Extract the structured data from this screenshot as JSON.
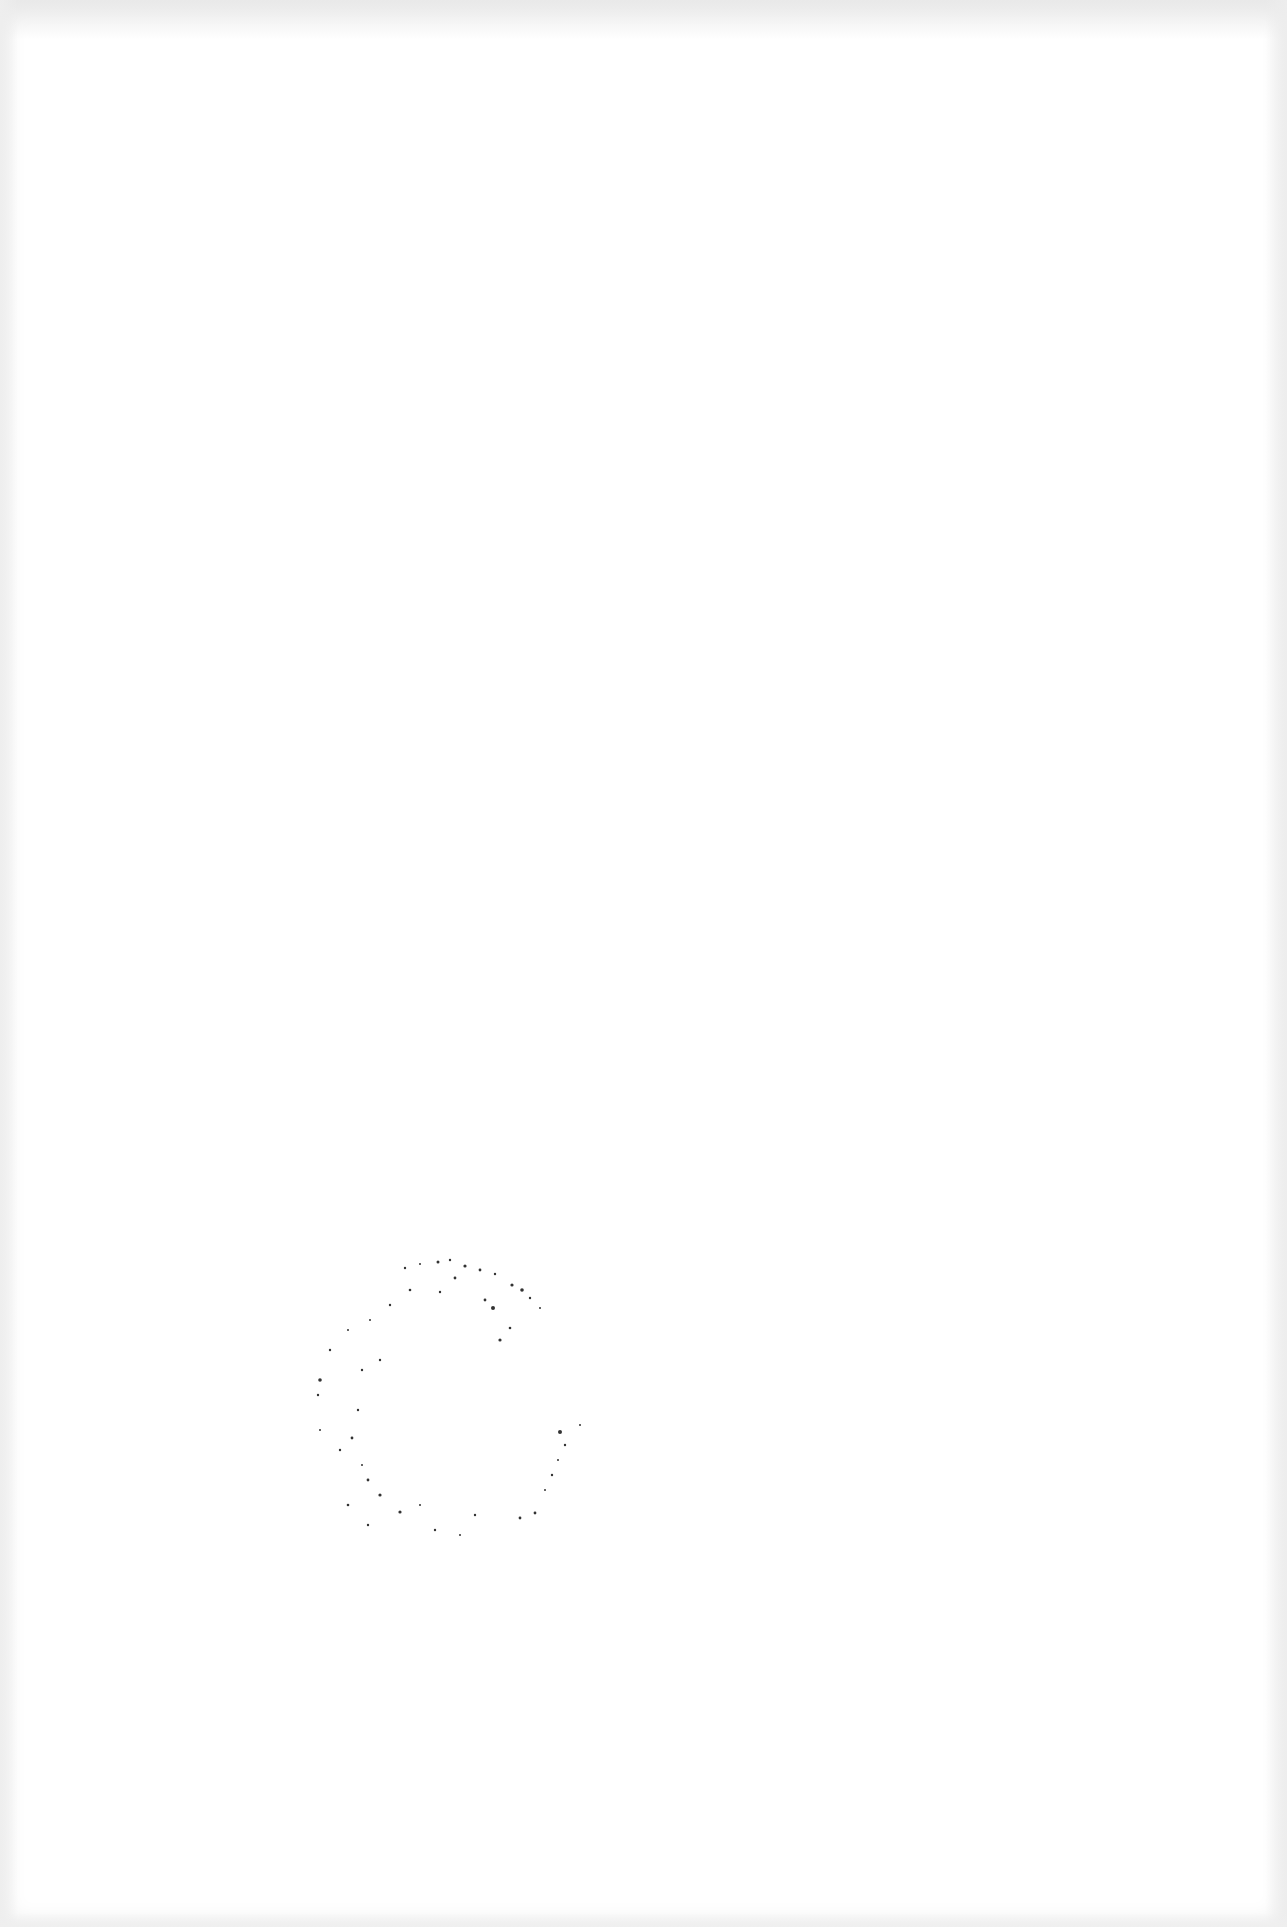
{
  "document": {
    "type": "scanned blank page",
    "background_color": "#ffffff",
    "edge_shade_color": "#ececec",
    "ghost_text": "",
    "stamp": {
      "shape": "circle",
      "text": "",
      "color": "#333333",
      "center": [
        440,
        1400
      ],
      "radius": 145
    }
  }
}
